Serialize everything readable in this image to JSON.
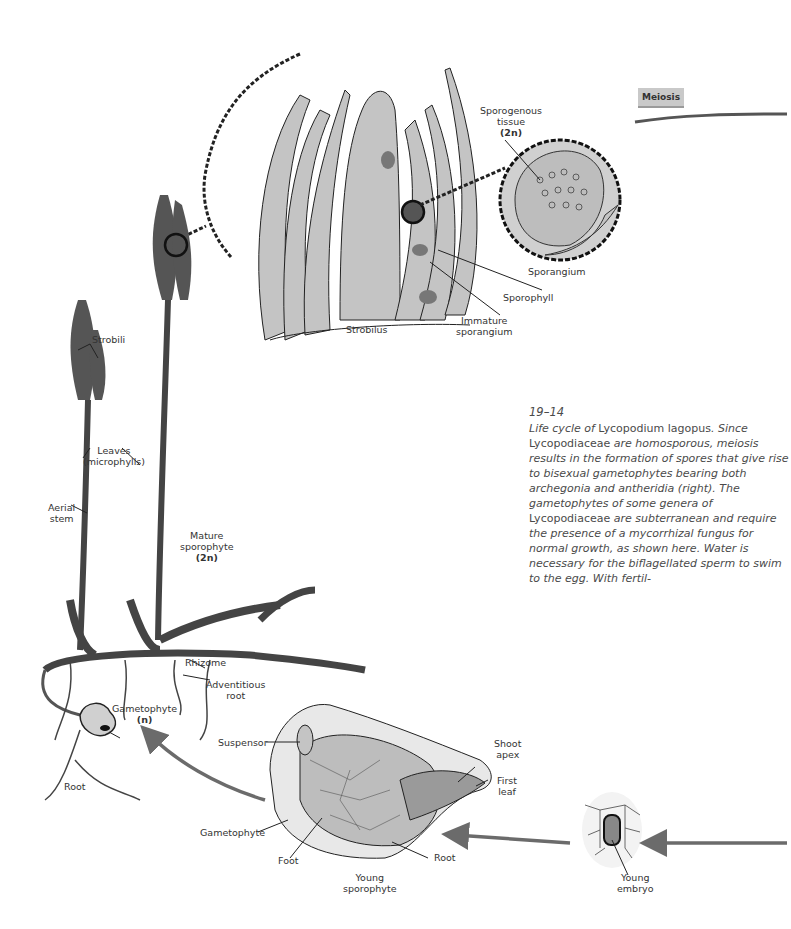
{
  "figure": {
    "number": "19–14",
    "caption_parts": [
      {
        "text": "Life cycle of ",
        "style": "italic"
      },
      {
        "text": "Lycopodium lagopus",
        "style": "upright"
      },
      {
        "text": ". Since ",
        "style": "italic"
      },
      {
        "text": "Lycopodiaceae",
        "style": "upright"
      },
      {
        "text": " are homosporous, meiosis results in the formation of spores that give rise to bisexual gametophytes bearing both archegonia and antheridia (right). The gametophytes of some genera of ",
        "style": "italic"
      },
      {
        "text": "Lycopodiaceae",
        "style": "upright"
      },
      {
        "text": " are subterranean and require the presence of a mycorrhizal fungus for normal growth, as shown here. Water is necessary for the biflagellated sperm to swim to the egg. With fertil-",
        "style": "italic"
      }
    ]
  },
  "stage_banner": {
    "label": "Meiosis"
  },
  "labels": {
    "sporogenous_tissue": {
      "line1": "Sporogenous",
      "line2": "tissue",
      "ploidy": "(2n)"
    },
    "sporangium": "Sporangium",
    "sporophyll": "Sporophyll",
    "immature_sporangium": {
      "line1": "Immature",
      "line2": "sporangium"
    },
    "strobilus": "Strobilus",
    "strobili": "Strobili",
    "leaves": {
      "line1": "Leaves",
      "line2": "(microphylls)"
    },
    "aerial_stem": {
      "line1": "Aerial",
      "line2": "stem"
    },
    "mature_sporophyte": {
      "line1": "Mature",
      "line2": "sporophyte",
      "ploidy": "(2n)"
    },
    "rhizome": "Rhizome",
    "adventitious_root": {
      "line1": "Adventitious",
      "line2": "root"
    },
    "gametophyte_n": {
      "line1": "Gametophyte",
      "ploidy": "(n)"
    },
    "root_left": "Root",
    "suspensor": "Suspensor",
    "shoot_apex": {
      "line1": "Shoot",
      "line2": "apex"
    },
    "first_leaf": {
      "line1": "First",
      "line2": "leaf"
    },
    "gametophyte": "Gametophyte",
    "foot": "Foot",
    "root_embryo": "Root",
    "young_sporophyte": {
      "line1": "Young",
      "line2": "sporophyte"
    },
    "young_embryo": {
      "line1": "Young",
      "line2": "embryo"
    }
  },
  "colors": {
    "tissue_fill": "#c4c4c4",
    "line": "#222222",
    "arrow": "#6b6b6b",
    "banner_bg": "#c9c9c9",
    "caption_text": "#4a4a4a"
  }
}
